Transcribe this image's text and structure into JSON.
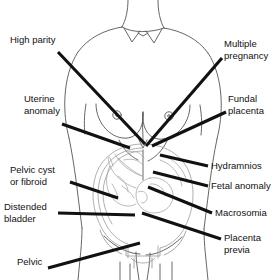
{
  "diagram": {
    "type": "annotated-anatomical-illustration",
    "background_color": "#ffffff",
    "line_color": "#000000",
    "body_outline_color": "#4a4a4a",
    "uterus_outline_color": "#8a8a8a",
    "leader_line_color": "#111111",
    "labels": [
      {
        "id": "high-parity",
        "text": "High parity",
        "side": "left",
        "text_x": 10,
        "text_y": 40,
        "leader": {
          "x1": 58,
          "y1": 52,
          "x2": 145,
          "y2": 144
        }
      },
      {
        "id": "uterine-anomaly",
        "text_lines": [
          "Uterine",
          "anomaly"
        ],
        "side": "left",
        "text_x": 24,
        "text_y": 99,
        "leader": {
          "x1": 62,
          "y1": 124,
          "x2": 130,
          "y2": 148
        }
      },
      {
        "id": "pelvic-cyst-or-fibroid",
        "text_lines": [
          "Pelvic cyst",
          "or fibroid"
        ],
        "side": "left",
        "text_x": 10,
        "text_y": 170,
        "leader": {
          "x1": 70,
          "y1": 182,
          "x2": 118,
          "y2": 198
        }
      },
      {
        "id": "distended-bladder",
        "text_lines": [
          "Distended",
          "bladder"
        ],
        "side": "left",
        "text_x": 4,
        "text_y": 207,
        "leader": {
          "x1": 58,
          "y1": 213,
          "x2": 135,
          "y2": 215
        }
      },
      {
        "id": "pelvic",
        "text": "Pelvic",
        "side": "left",
        "text_x": 17,
        "text_y": 262,
        "leader": {
          "x1": 48,
          "y1": 268,
          "x2": 140,
          "y2": 243
        }
      },
      {
        "id": "multiple-pregnancy",
        "text_lines": [
          "Multiple",
          "pregnancy"
        ],
        "side": "right",
        "text_x": 224,
        "text_y": 44,
        "leader": {
          "x1": 222,
          "y1": 58,
          "x2": 146,
          "y2": 146
        }
      },
      {
        "id": "fundal-placenta",
        "text_lines": [
          "Fundal",
          "placenta"
        ],
        "side": "right",
        "text_x": 228,
        "text_y": 99,
        "leader": {
          "x1": 226,
          "y1": 112,
          "x2": 152,
          "y2": 146
        }
      },
      {
        "id": "hydramnios",
        "text": "Hydramnios",
        "side": "right",
        "text_x": 211,
        "text_y": 160,
        "leader": {
          "x1": 208,
          "y1": 166,
          "x2": 160,
          "y2": 155
        }
      },
      {
        "id": "fetal-anomaly",
        "text": "Fetal anomaly",
        "side": "right",
        "text_x": 211,
        "text_y": 180,
        "leader": {
          "x1": 208,
          "y1": 186,
          "x2": 153,
          "y2": 172
        }
      },
      {
        "id": "macrosomia",
        "text": "Macrosomia",
        "side": "right",
        "text_x": 215,
        "text_y": 207,
        "leader": {
          "x1": 212,
          "y1": 213,
          "x2": 148,
          "y2": 187
        }
      },
      {
        "id": "placenta-previa",
        "text_lines": [
          "Placenta",
          "previa"
        ],
        "side": "right",
        "text_x": 224,
        "text_y": 232,
        "leader": {
          "x1": 221,
          "y1": 239,
          "x2": 142,
          "y2": 213
        }
      }
    ]
  }
}
